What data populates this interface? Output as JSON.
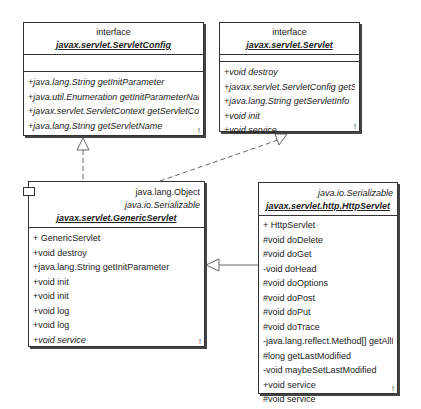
{
  "classes": {
    "servlet_config": {
      "stereotype": "interface",
      "name": "javax.servlet.ServletConfig",
      "operations": [
        "+java.lang.String getInitParameter",
        "+java.util.Enumeration getInitParameterNames",
        "+javax.servlet.ServletContext getServletContext",
        "+java.lang.String getServletName"
      ],
      "mark": "!"
    },
    "servlet": {
      "stereotype": "interface",
      "name": "javax.servlet.Servlet",
      "operations": [
        "+void destroy",
        "+javax.servlet.ServletConfig getServletConfig",
        "+java.lang.String getServletInfo",
        "+void init",
        "+void service"
      ],
      "mark": "!"
    },
    "generic_servlet": {
      "superclass": "java.lang.Object",
      "interface": "java.io.Serializable",
      "name": "javax.servlet.GenericServlet",
      "operations": [
        "+ GenericServlet",
        "+void destroy",
        "+java.lang.String getInitParameter",
        "+void init",
        "+void init",
        "+void log",
        "+void log",
        "+void service"
      ],
      "mark": "!"
    },
    "http_servlet": {
      "interface": "java.io.Serializable",
      "name": "javax.servlet.http.HttpServlet",
      "operations": [
        "+ HttpServlet",
        "#void doDelete",
        "#void doGet",
        "-void doHead",
        "#void doOptions",
        "#void doPost",
        "#void doPut",
        "#void doTrace",
        "-java.lang.reflect.Method[] getAllDeclaredMethods",
        "#long getLastModified",
        "-void maybeSetLastModified",
        "+void service",
        "#void service"
      ],
      "mark": "!"
    }
  },
  "relations": [
    {
      "from": "javax.servlet.GenericServlet",
      "to": "javax.servlet.ServletConfig",
      "type": "realization"
    },
    {
      "from": "javax.servlet.GenericServlet",
      "to": "javax.servlet.Servlet",
      "type": "realization"
    },
    {
      "from": "javax.servlet.http.HttpServlet",
      "to": "javax.servlet.GenericServlet",
      "type": "generalization"
    }
  ]
}
